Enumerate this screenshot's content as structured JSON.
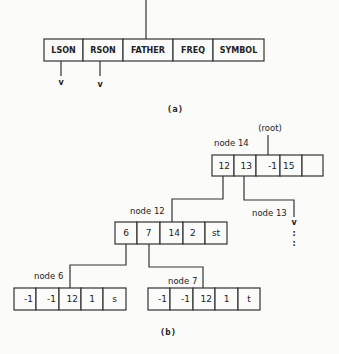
{
  "part_a": {
    "fields": [
      "LSON",
      "RSON",
      "FATHER",
      "FREQ",
      "SYMBOL"
    ],
    "arrow_glyph": "v",
    "caption": "(a)"
  },
  "part_b": {
    "root_label": "(root)",
    "nodes": {
      "node14": {
        "label": "node 14",
        "cells": [
          "12",
          "13",
          "-1",
          "15",
          ""
        ]
      },
      "node13": {
        "label": "node 13"
      },
      "node12": {
        "label": "node 12",
        "cells": [
          "6",
          "7",
          "14",
          "2",
          "st"
        ]
      },
      "node6": {
        "label": "node 6",
        "cells": [
          "-1",
          "-1",
          "12",
          "1",
          "s"
        ]
      },
      "node7": {
        "label": "node 7",
        "cells": [
          "-1",
          "-1",
          "12",
          "1",
          "t"
        ]
      }
    },
    "continuation": "v",
    "ellipsis": ":",
    "caption": "(b)"
  }
}
